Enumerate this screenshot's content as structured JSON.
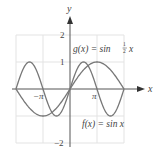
{
  "chart_data": {
    "type": "line",
    "title": "",
    "xlabel": "x",
    "ylabel": "y",
    "xlim": [
      -6.2832,
      6.2832
    ],
    "ylim": [
      -2,
      2
    ],
    "grid": true,
    "x_ticks": [
      {
        "value": -3.1416,
        "label": "-π"
      },
      {
        "value": 3.1416,
        "label": "π"
      }
    ],
    "y_ticks": [
      {
        "value": 2,
        "label": "2"
      },
      {
        "value": 1,
        "label": "1"
      },
      {
        "value": -2,
        "label": "−2"
      }
    ],
    "series": [
      {
        "name": "f(x) = sin x",
        "expr": "sin(x)",
        "domain": [
          -6.2832,
          6.2832
        ],
        "color": "#777777"
      },
      {
        "name": "g(x) = sin ½x",
        "expr": "sin(x/2)",
        "domain": [
          -6.2832,
          6.2832
        ],
        "color": "#777777"
      }
    ],
    "annotations": [
      {
        "text": "g(x) = sin ½x",
        "position": "upper right of y-axis"
      },
      {
        "text": "f(x) = sin x",
        "position": "lower right"
      }
    ]
  },
  "labels": {
    "x_axis": "x",
    "y_axis": "y",
    "tick_neg_pi": "−π",
    "tick_pi": "π",
    "tick_y2": "2",
    "tick_y1": "1",
    "tick_yneg2": "−2",
    "g_prefix": "g(x) = sin ",
    "g_frac_num": "1",
    "g_frac_den": "2",
    "g_suffix": "x",
    "f_label": "f(x) = sin x"
  },
  "colors": {
    "axis": "#555555",
    "grid": "#e3e3e3",
    "curve": "#777777"
  }
}
